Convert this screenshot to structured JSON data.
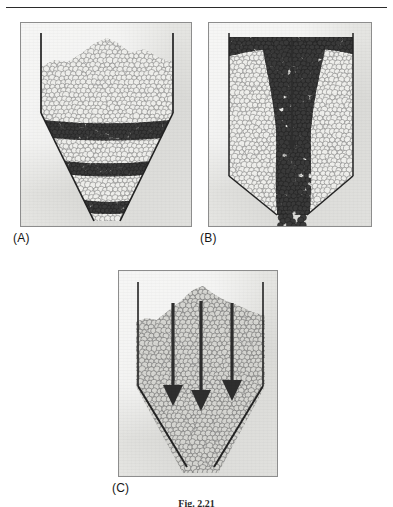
{
  "page": {
    "width": 393,
    "height": 507,
    "background_color": "#ffffff",
    "top_rule": true
  },
  "figure": {
    "caption": "Fig. 2.21",
    "caption_clipped": true
  },
  "colors": {
    "panel_background": "#e9e9e6",
    "panel_border": "#8d8d8d",
    "light_particle_fill": "#efefec",
    "light_particle_stroke": "#7d7d7d",
    "dark_particle_fill": "#3a3a3a",
    "mid_particle_fill": "#9a9a9a",
    "wall_line": "#232323",
    "arrow": "#2e2e2e",
    "label_text": "#151515"
  },
  "panels": [
    {
      "id": "A",
      "label": "(A)",
      "name": "mass-flow-hopper",
      "frame": {
        "x": 20,
        "y": 22,
        "width": 172,
        "height": 205
      },
      "label_pos": {
        "x": 13,
        "y": 231
      },
      "vessel": {
        "type": "wedge-hopper",
        "left_wall_x": 40,
        "right_wall_x": 172,
        "wall_top_y": 32,
        "bell_start_y": 112,
        "outlet_y": 220,
        "outlet_left_x": 93,
        "outlet_right_x": 119
      },
      "tracer_bands": 3,
      "band_description": "three curved dark tracer layers remaining parallel and evenly spaced as the bed descends",
      "arrows": 0
    },
    {
      "id": "B",
      "label": "(B)",
      "name": "funnel-flow-hopper",
      "frame": {
        "x": 208,
        "y": 22,
        "width": 164,
        "height": 205
      },
      "label_pos": {
        "x": 200,
        "y": 231
      },
      "vessel": {
        "type": "flat-bottom-bin",
        "left_wall_x": 228,
        "right_wall_x": 352,
        "wall_top_y": 32,
        "bell_start_y": 175,
        "outlet_y": 214,
        "outlet_left_x": 276,
        "outlet_right_x": 306
      },
      "tracer_bands": 0,
      "band_description": "central dark funnel channel with stagnant light material at the walls and a drawn-down surface crater",
      "arrows": 1,
      "arrow_list": [
        {
          "x": 291,
          "y_start": 38,
          "y_end": 150,
          "direction": "down"
        }
      ]
    },
    {
      "id": "C",
      "label": "(C)",
      "name": "flow-direction-hopper",
      "frame": {
        "x": 118,
        "y": 270,
        "width": 160,
        "height": 207
      },
      "label_pos": {
        "x": 112,
        "y": 481
      },
      "vessel": {
        "type": "wedge-hopper",
        "left_wall_x": 137,
        "right_wall_x": 262,
        "wall_top_y": 281,
        "bell_start_y": 385,
        "outlet_y": 466,
        "outlet_left_x": 186,
        "outlet_right_x": 213
      },
      "tracer_bands": 0,
      "band_description": "uniform packed bed with a heaped top surface",
      "arrows": 3,
      "arrow_list": [
        {
          "x": 172,
          "y_start": 302,
          "y_end": 405,
          "direction": "down"
        },
        {
          "x": 200,
          "y_start": 300,
          "y_end": 410,
          "direction": "down"
        },
        {
          "x": 231,
          "y_start": 302,
          "y_end": 400,
          "direction": "down"
        }
      ]
    }
  ]
}
